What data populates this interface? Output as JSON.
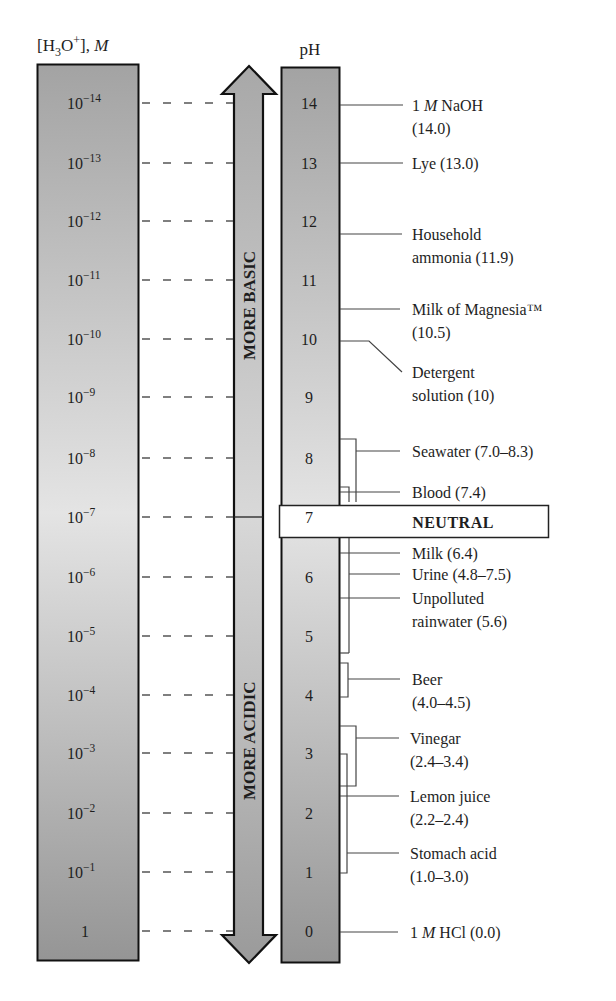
{
  "diagram": {
    "title_left": {
      "prefix": "[H",
      "sub": "3",
      "mid": "O",
      "sup": "+",
      "suffix": "], ",
      "unit": "M"
    },
    "title_right": "pH",
    "arrow_up_label": "MORE BASIC",
    "arrow_down_label": "MORE ACIDIC",
    "neutral_label": "NEUTRAL",
    "colors": {
      "column_dark": "#9a9a9a",
      "column_light": "#e2e2e2",
      "outline": "#111111",
      "dash": "#555555",
      "leader": "#444444"
    }
  },
  "concentration_ticks": [
    {
      "base": "10",
      "exp": "−14"
    },
    {
      "base": "10",
      "exp": "−13"
    },
    {
      "base": "10",
      "exp": "−12"
    },
    {
      "base": "10",
      "exp": "−11"
    },
    {
      "base": "10",
      "exp": "−10"
    },
    {
      "base": "10",
      "exp": "−9"
    },
    {
      "base": "10",
      "exp": "−8"
    },
    {
      "base": "10",
      "exp": "−7"
    },
    {
      "base": "10",
      "exp": "−6"
    },
    {
      "base": "10",
      "exp": "−5"
    },
    {
      "base": "10",
      "exp": "−4"
    },
    {
      "base": "10",
      "exp": "−3"
    },
    {
      "base": "10",
      "exp": "−2"
    },
    {
      "base": "10",
      "exp": "−1"
    },
    {
      "base": "1",
      "exp": ""
    }
  ],
  "ph_ticks": [
    "14",
    "13",
    "12",
    "11",
    "10",
    "9",
    "8",
    "7",
    "6",
    "5",
    "4",
    "3",
    "2",
    "1",
    "0"
  ],
  "substances": [
    {
      "name": "1 M NaOH",
      "line1_parts": [
        "1 ",
        "M",
        " NaOH"
      ],
      "line2": "(14.0)",
      "ph": "14.0"
    },
    {
      "name": "Lye",
      "line1": "Lye (13.0)",
      "line2": "",
      "ph": "13.0"
    },
    {
      "name": "Household ammonia",
      "line1": "Household",
      "line2": "ammonia (11.9)",
      "ph": "11.9"
    },
    {
      "name": "Milk of Magnesia",
      "line1": "Milk of Magnesia™",
      "line2": "(10.5)",
      "ph": "10.5"
    },
    {
      "name": "Detergent solution",
      "line1": "Detergent",
      "line2": "solution (10)",
      "ph": "10"
    },
    {
      "name": "Seawater",
      "line1": "Seawater (7.0–8.3)",
      "line2": "",
      "ph": "7.0–8.3"
    },
    {
      "name": "Blood",
      "line1": "Blood (7.4)",
      "line2": "",
      "ph": "7.4"
    },
    {
      "name": "Milk",
      "line1": "Milk (6.4)",
      "line2": "",
      "ph": "6.4"
    },
    {
      "name": "Urine",
      "line1": "Urine (4.8–7.5)",
      "line2": "",
      "ph": "4.8–7.5"
    },
    {
      "name": "Unpolluted rainwater",
      "line1": "Unpolluted",
      "line2": "rainwater (5.6)",
      "ph": "5.6"
    },
    {
      "name": "Beer",
      "line1": "Beer",
      "line2": "(4.0–4.5)",
      "ph": "4.0–4.5"
    },
    {
      "name": "Vinegar",
      "line1": "Vinegar",
      "line2": "(2.4–3.4)",
      "ph": "2.4–3.4"
    },
    {
      "name": "Lemon juice",
      "line1": "Lemon juice",
      "line2": "(2.2–2.4)",
      "ph": "2.2–2.4"
    },
    {
      "name": "Stomach acid",
      "line1": "Stomach acid",
      "line2": "(1.0–3.0)",
      "ph": "1.0–3.0"
    },
    {
      "name": "1 M HCl",
      "line1_parts": [
        "1 ",
        "M",
        " HCl (0.0)"
      ],
      "line2": "",
      "ph": "0.0"
    }
  ]
}
